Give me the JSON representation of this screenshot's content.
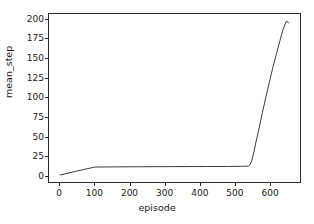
{
  "chart_data": {
    "type": "line",
    "title": "",
    "xlabel": "episode",
    "ylabel": "mean_step",
    "xlim": [
      -32,
      688
    ],
    "ylim": [
      -9,
      207
    ],
    "grid": false,
    "legend": null,
    "line_color": "#3a3a3a",
    "line_width": 1,
    "xticks": [
      0,
      100,
      200,
      300,
      400,
      500,
      600
    ],
    "yticks": [
      0,
      25,
      50,
      75,
      100,
      125,
      150,
      175,
      200
    ],
    "xtick_labels": [
      "0",
      "100",
      "200",
      "300",
      "400",
      "500",
      "600"
    ],
    "ytick_labels": [
      "0",
      "25",
      "50",
      "75",
      "100",
      "125",
      "150",
      "175",
      "200"
    ],
    "series": [
      {
        "name": "mean_step",
        "x": [
          0,
          20,
          40,
          60,
          80,
          100,
          120,
          150,
          180,
          210,
          240,
          270,
          300,
          330,
          360,
          390,
          420,
          450,
          480,
          500,
          520,
          535,
          540,
          545,
          550,
          556,
          562,
          570,
          580,
          590,
          600,
          610,
          620,
          630,
          640,
          648,
          652,
          655
        ],
        "y": [
          0,
          2.1,
          4.2,
          6.3,
          8.3,
          10.2,
          10.3,
          10.4,
          10.5,
          10.6,
          10.6,
          10.7,
          10.7,
          10.8,
          10.8,
          10.9,
          10.9,
          11.0,
          11.0,
          11.1,
          11.2,
          11.3,
          11.5,
          13.5,
          19.0,
          30.0,
          43.0,
          59.0,
          80.0,
          100.0,
          119.0,
          138.0,
          155.0,
          172.0,
          188.0,
          197.0,
          197.5,
          195.5
        ]
      }
    ]
  },
  "axis_labels": {
    "x": "episode",
    "y": "mean_step"
  }
}
